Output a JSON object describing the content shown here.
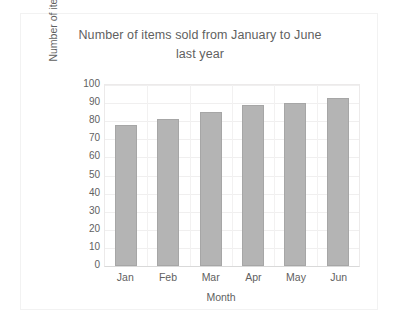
{
  "chart_data": {
    "type": "bar",
    "title": "Number of items sold from January to June last year",
    "title_line1": "Number of items sold from January to June",
    "title_line2": "last year",
    "categories": [
      "Jan",
      "Feb",
      "Mar",
      "Apr",
      "May",
      "Jun"
    ],
    "values": [
      78,
      81,
      85,
      89,
      90,
      93
    ],
    "xlabel": "Month",
    "ylabel": "Number of items sold",
    "ylim": [
      0,
      100
    ],
    "ytick_step": 10,
    "yticks": [
      100,
      90,
      80,
      70,
      60,
      50,
      40,
      30,
      20,
      10,
      0
    ],
    "grid": true,
    "legend": false,
    "bar_color": "#b4b4b4",
    "bar_border_color": "#a6a6a6",
    "text_color": "#5f5f5f",
    "background": "#ffffff"
  }
}
